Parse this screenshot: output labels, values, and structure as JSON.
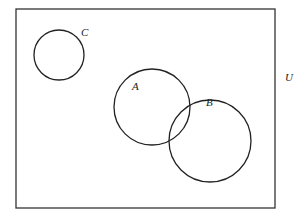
{
  "diagram": {
    "type": "venn",
    "universe_label": "U",
    "sets": [
      {
        "label": "C"
      },
      {
        "label": "A"
      },
      {
        "label": "B"
      }
    ]
  }
}
